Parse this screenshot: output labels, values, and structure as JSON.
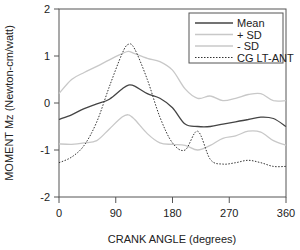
{
  "chart_data": {
    "type": "line",
    "title": "",
    "xlabel": "CRANK ANGLE (degrees)",
    "ylabel": "MOMENT Mz (Newton-cm/watt)",
    "xlim": [
      0,
      360
    ],
    "ylim": [
      -2,
      2
    ],
    "xticks": [
      0,
      90,
      180,
      270,
      360
    ],
    "yticks": [
      2,
      1,
      0,
      -1,
      -2
    ],
    "grid": false,
    "legend_position": "upper right",
    "x": [
      0,
      20,
      40,
      60,
      80,
      100,
      110,
      120,
      140,
      160,
      180,
      200,
      220,
      240,
      260,
      280,
      300,
      320,
      340,
      360
    ],
    "series": [
      {
        "name": "Mean",
        "style": "solid",
        "color": "#444444",
        "values": [
          -0.35,
          -0.25,
          -0.12,
          -0.02,
          0.08,
          0.3,
          0.38,
          0.36,
          0.2,
          0.1,
          -0.1,
          -0.45,
          -0.5,
          -0.5,
          -0.45,
          -0.4,
          -0.35,
          -0.3,
          -0.33,
          -0.5
        ]
      },
      {
        "name": "+ SD",
        "style": "solid",
        "color": "#c8c8c8",
        "values": [
          0.2,
          0.5,
          0.65,
          0.78,
          0.92,
          1.05,
          1.1,
          1.05,
          0.95,
          0.88,
          0.7,
          0.3,
          0.1,
          0.15,
          0.05,
          0.1,
          0.18,
          0.2,
          0.05,
          0.05
        ]
      },
      {
        "name": "- SD",
        "style": "solid",
        "color": "#c8c8c8",
        "values": [
          -0.87,
          -0.88,
          -0.85,
          -0.8,
          -0.55,
          -0.3,
          -0.25,
          -0.35,
          -0.65,
          -0.85,
          -0.88,
          -0.9,
          -1.0,
          -0.9,
          -0.75,
          -0.7,
          -0.6,
          -0.62,
          -0.8,
          -0.9
        ]
      },
      {
        "name": "CG LT-ANT",
        "style": "dotted",
        "color": "#333333",
        "values": [
          -1.27,
          -1.15,
          -0.9,
          -0.4,
          0.35,
          1.05,
          1.25,
          1.15,
          0.5,
          -0.3,
          -0.85,
          -1.0,
          -0.6,
          -1.2,
          -1.3,
          -1.27,
          -1.22,
          -1.27,
          -1.35,
          -1.35
        ]
      }
    ]
  }
}
